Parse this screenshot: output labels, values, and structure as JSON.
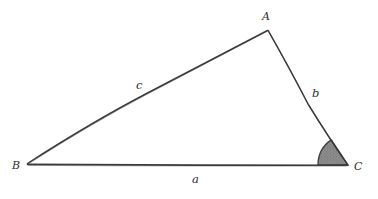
{
  "diagram": {
    "kind": "triangle-geometry-sketch",
    "style": "hand-drawn-pencil",
    "background_color": "#ffffff",
    "stroke_color": "#3a3a3a",
    "angle_fill_color": "#8a8a8a",
    "angle_stroke_color": "#3a3a3a",
    "width": 378,
    "height": 199,
    "vertices": [
      {
        "id": "A",
        "label": "A",
        "x": 268,
        "y": 30
      },
      {
        "id": "B",
        "label": "B",
        "x": 27,
        "y": 164
      },
      {
        "id": "C",
        "label": "C",
        "x": 348,
        "y": 165
      }
    ],
    "sides": [
      {
        "id": "a",
        "label": "a",
        "from": "B",
        "to": "C",
        "label_x": 196,
        "label_y": 181
      },
      {
        "id": "b",
        "label": "b",
        "from": "A",
        "to": "C",
        "label_x": 316,
        "label_y": 95
      },
      {
        "id": "c",
        "label": "c",
        "from": "A",
        "to": "B",
        "label_x": 141,
        "label_y": 87
      }
    ],
    "marked_angle": {
      "at_vertex": "C",
      "label": "",
      "radius": 30,
      "shaded": true,
      "fill": "#8a8a8a"
    }
  }
}
